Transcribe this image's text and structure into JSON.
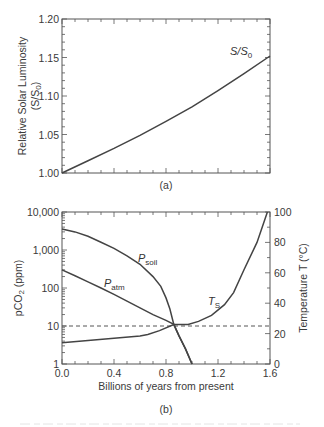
{
  "chart_data": [
    {
      "type": "line",
      "panel_label": "(a)",
      "title": "",
      "xlabel": "",
      "ylabel": "Relative Solar Luminosity",
      "ylabel_line2": "(S/S0)",
      "xlim": [
        0,
        1.6
      ],
      "ylim": [
        1.0,
        1.2
      ],
      "x_major_ticks": [
        0,
        0.4,
        0.8,
        1.2,
        1.6
      ],
      "x_tick_labels_shown": false,
      "y_ticks": [
        1.0,
        1.05,
        1.1,
        1.15,
        1.2
      ],
      "y_tick_labels": [
        "1.00",
        "1.05",
        "1.10",
        "1.15",
        "1.20"
      ],
      "grid": false,
      "series": [
        {
          "name": "S/S0",
          "label_main": "S/S",
          "label_sub": "0",
          "x": [
            0.0,
            0.2,
            0.4,
            0.6,
            0.8,
            1.0,
            1.2,
            1.4,
            1.6
          ],
          "values": [
            1.0,
            1.016,
            1.032,
            1.049,
            1.067,
            1.086,
            1.107,
            1.129,
            1.152
          ]
        }
      ]
    },
    {
      "type": "line",
      "panel_label": "(b)",
      "title": "",
      "xlabel": "Billions of years from present",
      "ylabel": "pCO2 (ppm)",
      "ylabel_main": "pCO",
      "ylabel_sub": "2",
      "ylabel_suffix": " (ppm)",
      "y2label": "Temperature T (°C)",
      "xlim": [
        0,
        1.6
      ],
      "ylim": [
        1,
        10000
      ],
      "yscale": "log",
      "y2lim": [
        0,
        100
      ],
      "x_ticks": [
        0,
        0.4,
        0.8,
        1.2,
        1.6
      ],
      "x_tick_labels": [
        "0.0",
        "0.4",
        "0.8",
        "1.2",
        "1.6"
      ],
      "y_ticks": [
        1,
        10,
        100,
        1000,
        10000
      ],
      "y_tick_labels": [
        "1",
        "10",
        "100",
        "1,000",
        "10,000"
      ],
      "y2_ticks": [
        0,
        20,
        40,
        60,
        80,
        100
      ],
      "y2_tick_labels": [
        "0",
        "20",
        "40",
        "60",
        "80",
        "100"
      ],
      "grid": false,
      "reference_line": {
        "axis": "left",
        "value": 10,
        "style": "dashed"
      },
      "series": [
        {
          "name": "P_soil",
          "label_main": "P",
          "label_sub": "soil",
          "axis": "left",
          "x": [
            0.0,
            0.1,
            0.2,
            0.3,
            0.4,
            0.5,
            0.6,
            0.7,
            0.76,
            0.8,
            0.83,
            0.86,
            0.9,
            0.95,
            1.0
          ],
          "values": [
            3600,
            3000,
            2300,
            1600,
            1100,
            700,
            420,
            200,
            110,
            55,
            28,
            11,
            5.5,
            2.5,
            1
          ]
        },
        {
          "name": "P_atm",
          "label_main": "P",
          "label_sub": "atm",
          "axis": "left",
          "x": [
            0.0,
            0.1,
            0.2,
            0.3,
            0.4,
            0.5,
            0.6,
            0.7,
            0.8,
            0.86,
            0.9,
            0.95,
            1.0
          ],
          "values": [
            300,
            210,
            145,
            100,
            68,
            45,
            30,
            20,
            14,
            11,
            5.5,
            2.5,
            1
          ]
        },
        {
          "name": "T_S",
          "label_main": "T",
          "label_sub": "S",
          "axis": "right",
          "x": [
            0.0,
            0.2,
            0.4,
            0.6,
            0.66,
            0.75,
            0.86,
            0.97,
            1.05,
            1.15,
            1.25,
            1.32,
            1.4,
            1.5,
            1.58
          ],
          "values": [
            14,
            15.5,
            17,
            18.5,
            19.5,
            22,
            26,
            26,
            28,
            32,
            39,
            47,
            62,
            80,
            100
          ]
        }
      ]
    }
  ],
  "caption_fragment": "—"
}
